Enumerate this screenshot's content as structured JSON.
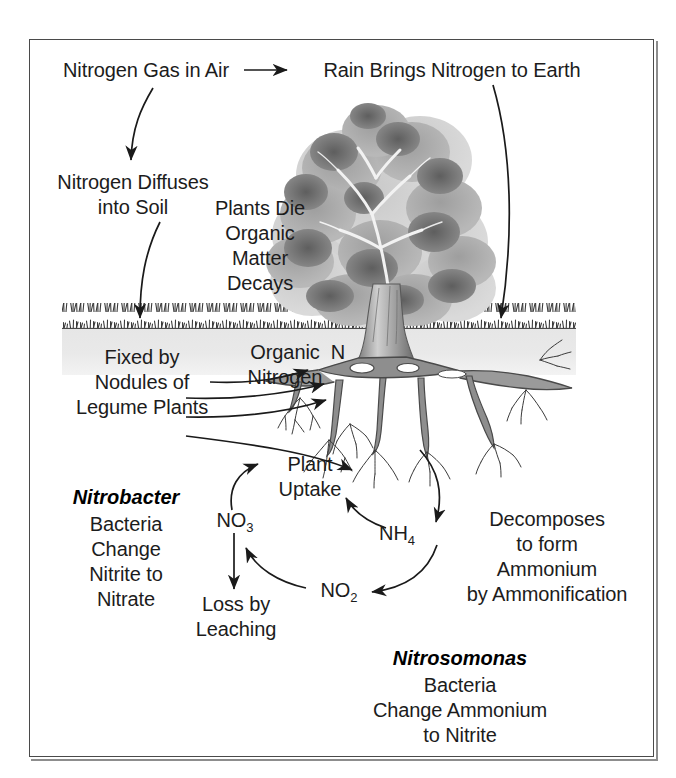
{
  "diagram": {
    "frame": {
      "border_color": "#4a4a4a"
    },
    "soil": {
      "band_color": "#e8e8e8"
    },
    "labels": {
      "nitrogen_gas": "Nitrogen Gas in Air",
      "rain_brings": "Rain Brings Nitrogen to Earth",
      "diffuses_line1": "Nitrogen Diffuses",
      "diffuses_line2": "into Soil",
      "plants_die_line1": "Plants Die",
      "plants_die_line2": "Organic",
      "plants_die_line3": "Matter",
      "plants_die_line4": "Decays",
      "fixed_line1": "Fixed by",
      "fixed_line2": "Nodules of",
      "fixed_line3": "Legume Plants",
      "organic_line1": "Organic",
      "organic_line2": "Nitrogen",
      "organic_n": "N",
      "plant_uptake_line1": "Plant",
      "plant_uptake_line2": "Uptake",
      "loss_line1": "Loss by",
      "loss_line2": "Leaching",
      "decomposes_line1": "Decomposes",
      "decomposes_line2": "to form",
      "decomposes_line3": "Ammonium",
      "decomposes_line4": "by Ammonification"
    },
    "compounds": {
      "nitrate": {
        "formula": "NO",
        "subscript": "3"
      },
      "nitrite": {
        "formula": "NO",
        "subscript": "2"
      },
      "ammonium": {
        "formula": "NH",
        "subscript": "4"
      }
    },
    "nitrobacter": {
      "name": "Nitrobacter",
      "line1": "Bacteria",
      "line2": "Change",
      "line3": "Nitrite to",
      "line4": "Nitrate"
    },
    "nitrosomonas": {
      "name": "Nitrosomonas",
      "line1": "Bacteria",
      "line2": "Change Ammonium",
      "line3": "to Nitrite"
    }
  }
}
